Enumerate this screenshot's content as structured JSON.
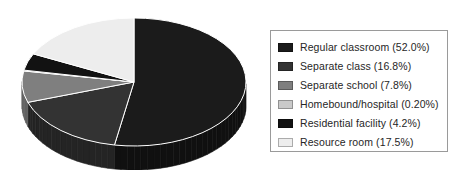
{
  "chart_data": {
    "type": "pie",
    "title": "",
    "subtitle": "",
    "xlabel": "",
    "ylabel": "",
    "grid": false,
    "legend_position": "right",
    "three_d": true,
    "value_unit": "%",
    "categories": [
      "Regular classroom",
      "Separate class",
      "Separate school",
      "Homebound/hospital",
      "Residential facility",
      "Resource room"
    ],
    "values": [
      52.0,
      16.8,
      7.8,
      0.2,
      4.2,
      17.5
    ],
    "value_labels": [
      "52.0%",
      "16.8%",
      "7.8%",
      "0.20%",
      "4.2%",
      "17.5%"
    ],
    "colors": [
      "#1b1b1b",
      "#333333",
      "#7f7f7f",
      "#c9c9c9",
      "#121212",
      "#ededed"
    ],
    "side_colors": [
      "#101010",
      "#242424",
      "#626262",
      "#a8a8a8",
      "#0a0a0a",
      "#c2c2c2"
    ],
    "slices": [
      {
        "label": "Regular classroom",
        "value": 52.0,
        "label_text": "Regular classroom (52.0%)",
        "color": "#1b1b1b"
      },
      {
        "label": "Separate class",
        "value": 16.8,
        "label_text": "Separate class (16.8%)",
        "color": "#333333"
      },
      {
        "label": "Separate school",
        "value": 7.8,
        "label_text": "Separate school (7.8%)",
        "color": "#7f7f7f"
      },
      {
        "label": "Homebound/hospital",
        "value": 0.2,
        "label_text": "Homebound/hospital (0.20%)",
        "color": "#c9c9c9"
      },
      {
        "label": "Residential facility",
        "value": 4.2,
        "label_text": "Residential facility (4.2%)",
        "color": "#121212"
      },
      {
        "label": "Resource room",
        "value": 17.5,
        "label_text": "Resource room (17.5%)",
        "color": "#ededed"
      }
    ]
  },
  "legend": {
    "items": [
      {
        "label_text": "Regular classroom (52.0%)"
      },
      {
        "label_text": "Separate class (16.8%)"
      },
      {
        "label_text": "Separate school (7.8%)"
      },
      {
        "label_text": "Homebound/hospital (0.20%)"
      },
      {
        "label_text": "Residential facility (4.2%)"
      },
      {
        "label_text": "Resource room (17.5%)"
      }
    ]
  }
}
